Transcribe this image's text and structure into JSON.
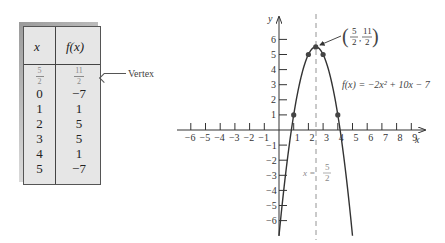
{
  "table": {
    "headers": [
      "x",
      "f(x)"
    ],
    "vertex_row": {
      "x": {
        "num": "5",
        "den": "2"
      },
      "fx": {
        "num": "11",
        "den": "2"
      }
    },
    "rows": [
      {
        "x": "0",
        "fx": "−7"
      },
      {
        "x": "1",
        "fx": "1"
      },
      {
        "x": "2",
        "fx": "5"
      },
      {
        "x": "3",
        "fx": "5"
      },
      {
        "x": "4",
        "fx": "1"
      },
      {
        "x": "5",
        "fx": "−7"
      }
    ],
    "vertex_label": "Vertex"
  },
  "graph": {
    "x_axis_label": "x",
    "y_axis_label": "y",
    "x_ticks": [
      "−6",
      "−5",
      "−4",
      "−3",
      "−2",
      "−1",
      "1",
      "2",
      "3",
      "4",
      "5",
      "6",
      "7",
      "8",
      "9"
    ],
    "y_ticks": [
      "6",
      "5",
      "4",
      "3",
      "2",
      "1",
      "−1",
      "−2",
      "−3",
      "−4",
      "−5",
      "−6"
    ],
    "function_label": "f(x) = −2x² + 10x − 7",
    "vertex_annotation": {
      "x_num": "5",
      "x_den": "2",
      "y_num": "11",
      "y_den": "2"
    },
    "axis_of_symmetry_label": {
      "lhs": "x = ",
      "num": "5",
      "den": "2"
    }
  },
  "chart_data": {
    "type": "line",
    "title": "",
    "function": "f(x) = -2x^2 + 10x - 7",
    "xlabel": "x",
    "ylabel": "y",
    "xlim": [
      -6,
      9
    ],
    "ylim": [
      -6,
      6
    ],
    "grid": false,
    "series": [
      {
        "name": "f(x) = -2x^2 + 10x - 7",
        "x": [
          0,
          1,
          2,
          2.5,
          3,
          4,
          5
        ],
        "y": [
          -7,
          1,
          5,
          5.5,
          5,
          1,
          -7
        ]
      }
    ],
    "marked_points": [
      [
        1,
        1
      ],
      [
        2,
        5
      ],
      [
        2.5,
        5.5
      ],
      [
        3,
        5
      ],
      [
        4,
        1
      ]
    ],
    "vertex": [
      2.5,
      5.5
    ],
    "axis_of_symmetry": 2.5,
    "annotations": [
      "(5/2, 11/2)",
      "f(x) = -2x^2 + 10x - 7",
      "x = 5/2"
    ],
    "table": {
      "columns": [
        "x",
        "f(x)"
      ],
      "rows": [
        [
          "5/2",
          "11/2"
        ],
        [
          "0",
          "-7"
        ],
        [
          "1",
          "1"
        ],
        [
          "2",
          "5"
        ],
        [
          "3",
          "5"
        ],
        [
          "4",
          "1"
        ],
        [
          "5",
          "-7"
        ]
      ]
    }
  }
}
